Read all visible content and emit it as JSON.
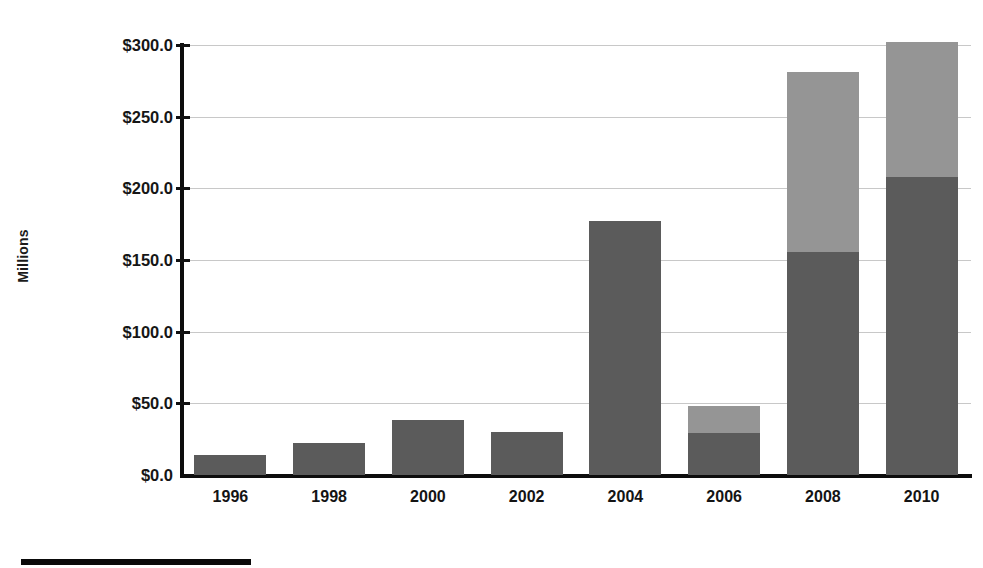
{
  "chart_data": {
    "type": "bar",
    "stacked": true,
    "title": "",
    "subtitle": "",
    "xlabel": "",
    "ylabel": "Millions",
    "categories": [
      "1996",
      "1998",
      "2000",
      "2002",
      "2004",
      "2006",
      "2008",
      "2010"
    ],
    "series": [
      {
        "name": "series-1-dark",
        "color": "#5b5b5b",
        "values": [
          14.0,
          22.5,
          38.5,
          30.0,
          177.0,
          29.5,
          155.5,
          208.0
        ]
      },
      {
        "name": "series-2-light",
        "color": "#959595",
        "values": [
          0,
          0,
          0,
          0,
          0,
          18.5,
          126.0,
          94.0
        ]
      }
    ],
    "totals": [
      14.0,
      22.5,
      38.5,
      30.0,
      177.0,
      48.0,
      281.5,
      302.0
    ],
    "ylim": [
      0,
      300
    ],
    "y_ticks": [
      0,
      50,
      100,
      150,
      200,
      250,
      300
    ],
    "y_tick_labels": [
      "$0.0",
      "$50.0",
      "$100.0",
      "$150.0",
      "$200.0",
      "$250.0",
      "$300.0"
    ],
    "grid": true,
    "grid_axis": "y",
    "legend_position": "bottom-left",
    "legend_visible_partial": true,
    "value_prefix": "$",
    "value_suffix": "",
    "annotations": []
  },
  "axis": {
    "y_title": "Millions"
  },
  "colors": {
    "dark_series": "#5b5b5b",
    "light_series": "#959595",
    "axis": "#0d0d0d",
    "gridline": "#c8c8c8",
    "text": "#141414",
    "background": "#ffffff"
  }
}
